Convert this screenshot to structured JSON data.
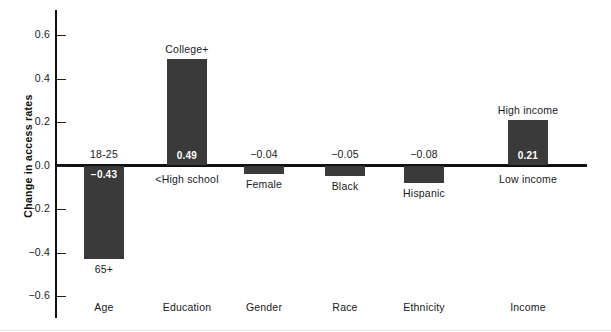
{
  "chart_data": {
    "type": "bar",
    "title": "",
    "subtitle": "",
    "xlabel": "",
    "ylabel": "Change in access rates",
    "ylim": [
      -0.6,
      0.6
    ],
    "grid": false,
    "legend": "none",
    "orientation": "vertical",
    "bar_color": "#3a3a3a",
    "zero_line": true,
    "y_ticks": [
      "0.6",
      "0.4",
      "0.2",
      "0.0",
      "-0.2",
      "-0.4",
      "-0.6"
    ],
    "y_tick_values": [
      0.6,
      0.4,
      0.2,
      0.0,
      -0.2,
      -0.4,
      -0.6
    ],
    "categories": [
      "Age",
      "Education",
      "Gender",
      "Race",
      "Ethnicity",
      "Income"
    ],
    "values": [
      -0.43,
      0.49,
      -0.04,
      -0.05,
      -0.08,
      0.21
    ],
    "value_labels": [
      "-0.43",
      "0.49",
      "-0.04",
      "-0.05",
      "-0.08",
      "0.21"
    ],
    "points": [
      {
        "category": "Age",
        "value": -0.43,
        "value_label": "-0.43",
        "reference_label": "18-25",
        "comparison_label": "65+"
      },
      {
        "category": "Education",
        "value": 0.49,
        "value_label": "0.49",
        "reference_label": "College+",
        "comparison_label": "<High school"
      },
      {
        "category": "Gender",
        "value": -0.04,
        "value_label": "-0.04",
        "reference_label": "",
        "comparison_label": "Female"
      },
      {
        "category": "Race",
        "value": -0.05,
        "value_label": "-0.05",
        "reference_label": "",
        "comparison_label": "Black"
      },
      {
        "category": "Ethnicity",
        "value": -0.08,
        "value_label": "-0.08",
        "reference_label": "",
        "comparison_label": "Hispanic"
      },
      {
        "category": "Income",
        "value": 0.21,
        "value_label": "0.21",
        "reference_label": "High income",
        "comparison_label": "Low income"
      }
    ]
  },
  "axis": {
    "y_title": "Change in access rates",
    "ticks": [
      {
        "label": "0.6"
      },
      {
        "label": "0.4"
      },
      {
        "label": "0.2"
      },
      {
        "label": "0.0"
      },
      {
        "label": "-0.2"
      },
      {
        "label": "-0.4"
      },
      {
        "label": "-0.6"
      }
    ]
  },
  "categories": [
    {
      "label": "Age"
    },
    {
      "label": "Education"
    },
    {
      "label": "Gender"
    },
    {
      "label": "Race"
    },
    {
      "label": "Ethnicity"
    },
    {
      "label": "Income"
    }
  ]
}
